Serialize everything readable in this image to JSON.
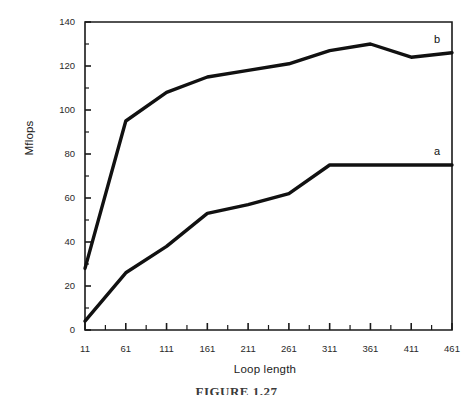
{
  "figure": {
    "caption": "FIGURE 1.27",
    "background_color": "#ffffff",
    "line_color": "#111111",
    "axis_color": "#1a1a1a"
  },
  "chart_data": {
    "type": "line",
    "title": "",
    "xlabel": "Loop length",
    "ylabel": "Mflops",
    "xlim": [
      11,
      461
    ],
    "ylim": [
      0,
      140
    ],
    "grid": false,
    "legend_position": "right-inline",
    "x_tick_labels": [
      "11",
      "61",
      "111",
      "161",
      "211",
      "261",
      "311",
      "361",
      "411",
      "461"
    ],
    "x_ticks": [
      11,
      61,
      111,
      161,
      211,
      261,
      311,
      361,
      411,
      461
    ],
    "x_minor_step": 25,
    "y_tick_labels": [
      "0",
      "20",
      "40",
      "60",
      "80",
      "100",
      "120",
      "140"
    ],
    "y_ticks": [
      0,
      20,
      40,
      60,
      80,
      100,
      120,
      140
    ],
    "y_minor_step": 10,
    "x": [
      11,
      61,
      111,
      161,
      211,
      261,
      311,
      361,
      411,
      461
    ],
    "series": [
      {
        "name": "a",
        "label": "a",
        "values": [
          4,
          26,
          38,
          53,
          57,
          62,
          75,
          75,
          75,
          75
        ]
      },
      {
        "name": "b",
        "label": "b",
        "values": [
          28,
          95,
          108,
          115,
          118,
          121,
          127,
          130,
          124,
          126
        ]
      }
    ]
  }
}
